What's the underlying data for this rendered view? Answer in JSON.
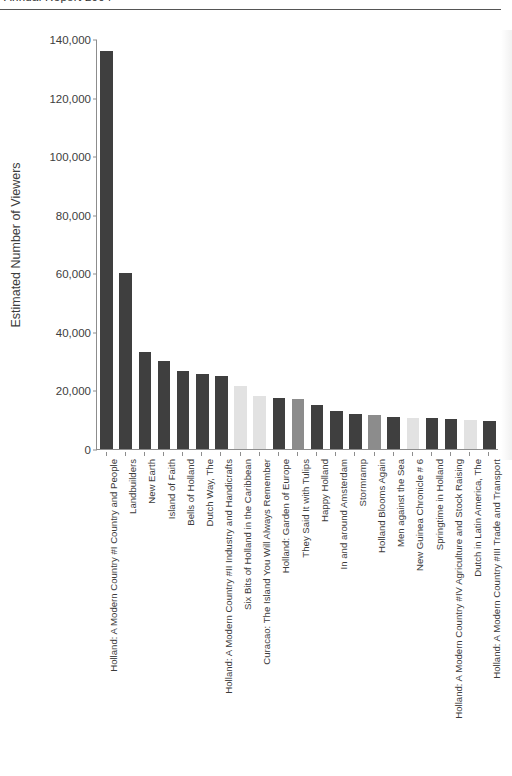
{
  "header": {
    "cropped_caption": "Annual Report 2004",
    "rule_color": "#555555"
  },
  "chart_data": {
    "type": "bar",
    "title": "",
    "subtitle": "",
    "xlabel": "",
    "ylabel": "Estimated Number of Viewers",
    "ylim": [
      0,
      140000
    ],
    "ytick_values": [
      0,
      20000,
      40000,
      60000,
      80000,
      100000,
      120000,
      140000
    ],
    "ytick_labels": [
      "0",
      "20,000",
      "40,000",
      "60,000",
      "80,000",
      "100,000",
      "120,000",
      "140,000"
    ],
    "grid": false,
    "legend": null,
    "legend_position": "none",
    "orientation": "vertical",
    "bar_colors": {
      "dark": "#3f3f3f",
      "medium": "#8c8c8c",
      "light": "#e2e2e2"
    },
    "categories": [
      "Holland: A Modern Country #I Country and People",
      "Landbuilders",
      "New Earth",
      "Island of Faith",
      "Bells of Holland",
      "Dutch Way, The",
      "Holland: A Modern Country #II Industry and Handicrafts",
      "Six Bits of Holland in the Caribbean",
      "Curacao: The Island You Will Always Remember",
      "Holland: Garden of Europe",
      "They Said It with Tulips",
      "Happy Holland",
      "In and around Amsterdam",
      "Stormramp",
      "Holland Blooms Again",
      "Men against the Sea",
      "New Guinea Chronicle # 6",
      "Springtime in Holland",
      "Holland: A Modern Country #IV Agriculture and Stock Raising",
      "Dutch in Latin America, The",
      "Holland: A Modern Country #III Trade and Transport"
    ],
    "values": [
      136000,
      60000,
      33000,
      30000,
      26500,
      25500,
      25000,
      21500,
      18000,
      17500,
      17000,
      15000,
      13000,
      12000,
      11500,
      11000,
      10500,
      10500,
      10300,
      9800,
      9500
    ],
    "shades": [
      "dark",
      "dark",
      "dark",
      "dark",
      "dark",
      "dark",
      "dark",
      "light",
      "light",
      "dark",
      "medium",
      "dark",
      "dark",
      "dark",
      "medium",
      "dark",
      "light",
      "dark",
      "dark",
      "light",
      "dark"
    ]
  }
}
